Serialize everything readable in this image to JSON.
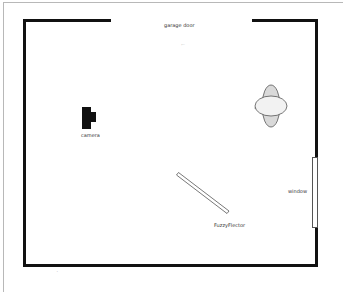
{
  "diagram": {
    "type": "floor-plan",
    "labels": {
      "garage_door": "garage door",
      "camera": "camera",
      "window": "window",
      "reflector": "FuzzyFlector"
    },
    "marks": {
      "top_faint": "⌐",
      "bottom_tick": "˙"
    },
    "colors": {
      "wall": "#111111",
      "frame": "#b8b8b8",
      "person_fill": "#d9d9d9",
      "head_fill": "#f2f2f2",
      "window_fill": "#ffffff",
      "label": "#333333"
    }
  }
}
